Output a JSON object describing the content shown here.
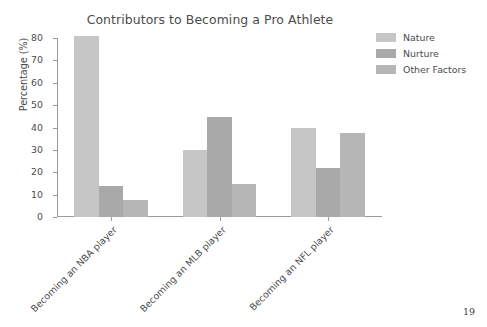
{
  "slide": {
    "page_number": "19",
    "background_color": "#ffffff"
  },
  "chart_data": {
    "type": "bar",
    "title": "Contributors to Becoming a Pro Athlete",
    "xlabel": "",
    "ylabel": "Percentage (%)",
    "ylim": [
      0,
      80
    ],
    "yticks": [
      0,
      10,
      20,
      30,
      40,
      50,
      60,
      70,
      80
    ],
    "ytick_labels": [
      "0",
      "10",
      "20",
      "30",
      "40",
      "50",
      "60",
      "70",
      "80"
    ],
    "grid": false,
    "legend_position": "upper right outside",
    "categories": [
      "Becoming an NBA player",
      "Becoming an MLB player",
      "Becoming an NFL player"
    ],
    "series": [
      {
        "name": "Nature",
        "color": "#c6c6c6",
        "values": [
          81.0,
          29.8,
          39.8
        ]
      },
      {
        "name": "Nurture",
        "color": "#a9a9a9",
        "values": [
          13.8,
          44.6,
          21.8
        ]
      },
      {
        "name": "Other Factors",
        "color": "#b6b6b6",
        "values": [
          7.5,
          14.8,
          37.6
        ]
      }
    ]
  },
  "axis_style": {
    "spine_color": "#9a9a9a",
    "tick_color": "#9a9a9a",
    "text_color": "#4b4b4b"
  }
}
